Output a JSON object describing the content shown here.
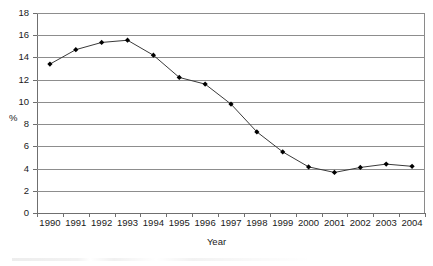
{
  "chart_data": {
    "type": "line",
    "title": "",
    "xlabel": "Year",
    "ylabel": "%",
    "categories": [
      "1990",
      "1991",
      "1992",
      "1993",
      "1994",
      "1995",
      "1996",
      "1997",
      "1998",
      "1999",
      "2000",
      "2001",
      "2002",
      "2003",
      "2004"
    ],
    "values": [
      13.4,
      14.7,
      15.35,
      15.55,
      14.2,
      12.2,
      11.6,
      9.8,
      7.3,
      5.5,
      4.15,
      3.65,
      4.1,
      4.4,
      4.2
    ],
    "series": [
      {
        "name": "%",
        "values": [
          13.4,
          14.7,
          15.35,
          15.55,
          14.2,
          12.2,
          11.6,
          9.8,
          7.3,
          5.5,
          4.15,
          3.65,
          4.1,
          4.4,
          4.2
        ]
      }
    ],
    "ylim": [
      0,
      18
    ],
    "ytick_step": 2,
    "yticks": [
      "0",
      "2",
      "4",
      "6",
      "8",
      "10",
      "12",
      "14",
      "16",
      "18"
    ],
    "grid": "horizontal",
    "legend": "none",
    "marker": "diamond",
    "line_color": "#3a3a3a",
    "marker_color": "#000000",
    "grid_color": "#8d8d8d",
    "axis_color": "#6f6f6f",
    "background": "#ffffff"
  },
  "axis": {
    "y_title": "%",
    "x_title": "Year"
  }
}
